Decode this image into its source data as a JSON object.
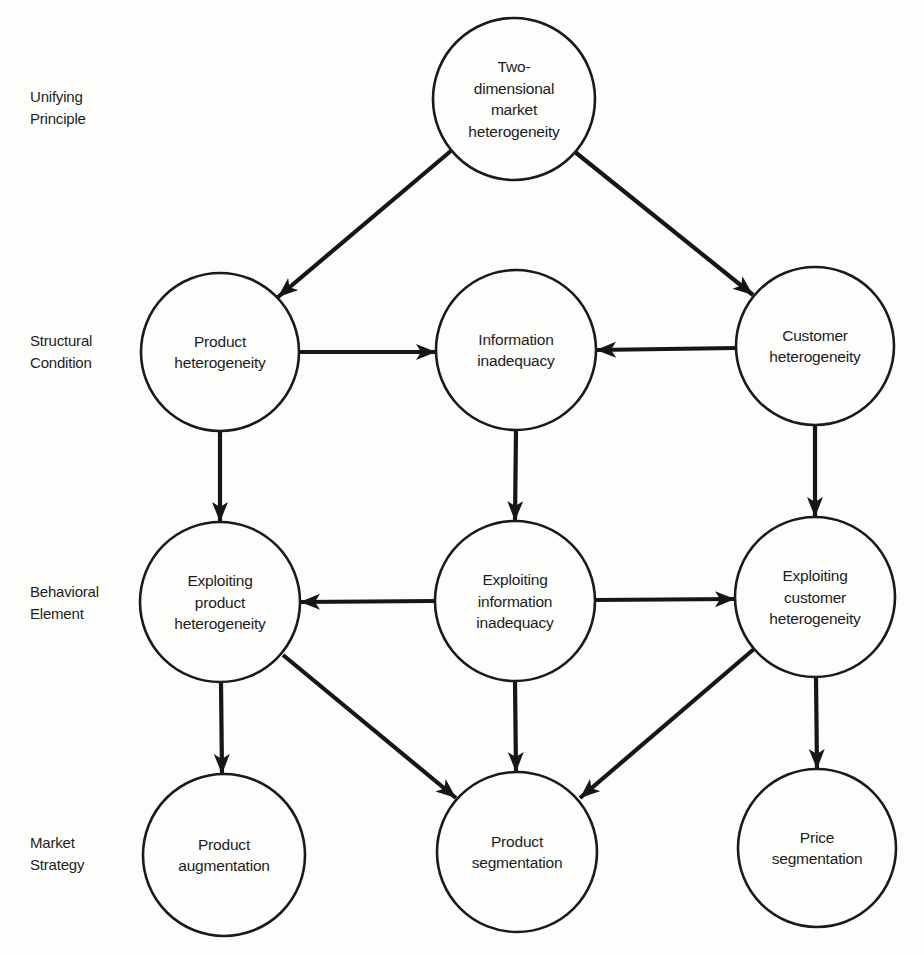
{
  "diagram": {
    "title": "",
    "row_labels": [
      {
        "id": "unifying-principle",
        "text": "Unifying\nPrinciple",
        "x": 30,
        "y": 86
      },
      {
        "id": "structural-condition",
        "text": "Structural\nCondition",
        "x": 30,
        "y": 330
      },
      {
        "id": "behavioral-element",
        "text": "Behavioral\nElement",
        "x": 30,
        "y": 581
      },
      {
        "id": "market-strategy",
        "text": "Market\nStrategy",
        "x": 30,
        "y": 832
      }
    ],
    "nodes": [
      {
        "id": "two-dimensional-market-heterogeneity",
        "lines": [
          "Two-",
          "dimensional",
          "market",
          "heterogeneity"
        ],
        "cx": 514,
        "cy": 99,
        "r": 81,
        "row": "Unifying Principle"
      },
      {
        "id": "product-heterogeneity",
        "lines": [
          "Product",
          "heterogeneity"
        ],
        "cx": 220,
        "cy": 352,
        "r": 79,
        "row": "Structural Condition"
      },
      {
        "id": "information-inadequacy",
        "lines": [
          "Information",
          "inadequacy"
        ],
        "cx": 516,
        "cy": 350,
        "r": 80,
        "row": "Structural Condition"
      },
      {
        "id": "customer-heterogeneity",
        "lines": [
          "Customer",
          "heterogeneity"
        ],
        "cx": 815,
        "cy": 346,
        "r": 79,
        "row": "Structural Condition"
      },
      {
        "id": "exploiting-product-heterogeneity",
        "lines": [
          "Exploiting",
          "product",
          "heterogeneity"
        ],
        "cx": 220,
        "cy": 602,
        "r": 80,
        "row": "Behavioral Element"
      },
      {
        "id": "exploiting-information-inadequacy",
        "lines": [
          "Exploiting",
          "information",
          "inadequacy"
        ],
        "cx": 515,
        "cy": 601,
        "r": 80,
        "row": "Behavioral Element"
      },
      {
        "id": "exploiting-customer-heterogeneity",
        "lines": [
          "Exploiting",
          "customer",
          "heterogeneity"
        ],
        "cx": 815,
        "cy": 597,
        "r": 80,
        "row": "Behavioral Element"
      },
      {
        "id": "product-augmentation",
        "lines": [
          "Product",
          "augmentation"
        ],
        "cx": 224,
        "cy": 855,
        "r": 81,
        "row": "Market Strategy"
      },
      {
        "id": "product-segmentation",
        "lines": [
          "Product",
          "segmentation"
        ],
        "cx": 517,
        "cy": 852,
        "r": 80,
        "row": "Market Strategy"
      },
      {
        "id": "price-segmentation",
        "lines": [
          "Price",
          "segmentation"
        ],
        "cx": 817,
        "cy": 848,
        "r": 79,
        "row": "Market Strategy"
      }
    ],
    "edges": [
      {
        "from": "two-dimensional-market-heterogeneity",
        "to": "product-heterogeneity",
        "x1": 452,
        "y1": 150,
        "x2": 278,
        "y2": 297
      },
      {
        "from": "two-dimensional-market-heterogeneity",
        "to": "customer-heterogeneity",
        "x1": 575,
        "y1": 152,
        "x2": 753,
        "y2": 295
      },
      {
        "from": "product-heterogeneity",
        "to": "information-inadequacy",
        "x1": 299,
        "y1": 352,
        "x2": 436,
        "y2": 352
      },
      {
        "from": "customer-heterogeneity",
        "to": "information-inadequacy",
        "x1": 736,
        "y1": 348,
        "x2": 596,
        "y2": 350
      },
      {
        "from": "product-heterogeneity",
        "to": "exploiting-product-heterogeneity",
        "x1": 220,
        "y1": 431,
        "x2": 220,
        "y2": 522
      },
      {
        "from": "information-inadequacy",
        "to": "exploiting-information-inadequacy",
        "x1": 516,
        "y1": 430,
        "x2": 515,
        "y2": 521
      },
      {
        "from": "customer-heterogeneity",
        "to": "exploiting-customer-heterogeneity",
        "x1": 815,
        "y1": 425,
        "x2": 815,
        "y2": 517
      },
      {
        "from": "exploiting-information-inadequacy",
        "to": "exploiting-product-heterogeneity",
        "x1": 435,
        "y1": 601,
        "x2": 300,
        "y2": 602
      },
      {
        "from": "exploiting-information-inadequacy",
        "to": "exploiting-customer-heterogeneity",
        "x1": 595,
        "y1": 600,
        "x2": 735,
        "y2": 599
      },
      {
        "from": "exploiting-product-heterogeneity",
        "to": "product-augmentation",
        "x1": 221,
        "y1": 682,
        "x2": 222,
        "y2": 774
      },
      {
        "from": "exploiting-product-heterogeneity",
        "to": "product-segmentation",
        "x1": 283,
        "y1": 655,
        "x2": 456,
        "y2": 798
      },
      {
        "from": "exploiting-information-inadequacy",
        "to": "product-segmentation",
        "x1": 515,
        "y1": 681,
        "x2": 516,
        "y2": 772
      },
      {
        "from": "exploiting-customer-heterogeneity",
        "to": "product-segmentation",
        "x1": 754,
        "y1": 649,
        "x2": 580,
        "y2": 798
      },
      {
        "from": "exploiting-customer-heterogeneity",
        "to": "price-segmentation",
        "x1": 816,
        "y1": 677,
        "x2": 817,
        "y2": 769
      }
    ],
    "style": {
      "line_color": "#161616",
      "node_fill": "#fdfdfc",
      "background": "#fdfdfc"
    }
  }
}
